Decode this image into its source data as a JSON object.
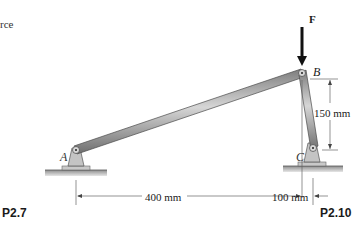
{
  "figure": {
    "left_crop_text": "rce",
    "force_label": "F",
    "points": {
      "A": "A",
      "B": "B",
      "C": "C"
    },
    "dimensions": {
      "vertical_BC": "150 mm",
      "horizontal_AB": "400 mm",
      "horizontal_BC": "100 mm"
    },
    "captions": {
      "left": "P2.7",
      "right": "P2.10"
    },
    "colors": {
      "link_fill": "#9a9a9a",
      "link_highlight": "#d0d0d0",
      "ground": "#b5b5b5",
      "dimension_line": "#555555",
      "arrow": "#111111"
    }
  }
}
